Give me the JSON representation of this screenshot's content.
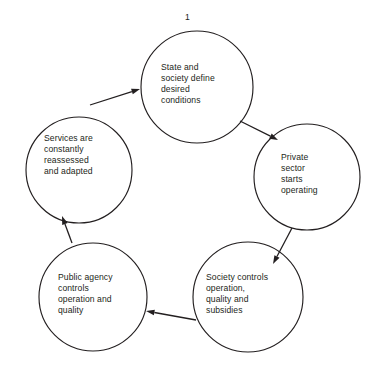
{
  "figure": {
    "number_label": "1",
    "background_color": "#ffffff",
    "stroke_color": "#231f20",
    "text_color": "#231f20"
  },
  "nodes": [
    {
      "id": "state-society-define",
      "text": "State and\nsociety define\ndesired\nconditions",
      "cx": 197,
      "cy": 87,
      "r": 56,
      "text_left": 161,
      "text_top": 62
    },
    {
      "id": "private-sector-operating",
      "text": "Private\nsector\nstarts\noperating",
      "cx": 307,
      "cy": 177,
      "r": 53,
      "text_left": 281,
      "text_top": 152
    },
    {
      "id": "society-controls",
      "text": "Society controls\noperation,\nquality and\nsubsidies",
      "cx": 248,
      "cy": 297,
      "r": 55,
      "text_left": 206,
      "text_top": 272
    },
    {
      "id": "public-agency-controls",
      "text": "Public agency\ncontrols\noperation and\nquality",
      "cx": 93,
      "cy": 297,
      "r": 54,
      "text_left": 58,
      "text_top": 272
    },
    {
      "id": "services-reassessed",
      "text": "Services are\nconstantly\nreassessed\nand adapted",
      "cx": 79,
      "cy": 170,
      "r": 53,
      "text_left": 44,
      "text_top": 133
    }
  ],
  "arrows": [
    {
      "id": "arrow-state-to-private",
      "from": "state-society-define",
      "to": "private-sector-operating",
      "x1": 240,
      "y1": 121,
      "x2": 278,
      "y2": 140
    },
    {
      "id": "arrow-private-to-society",
      "from": "private-sector-operating",
      "to": "society-controls",
      "x1": 292,
      "y1": 228,
      "x2": 273,
      "y2": 264
    },
    {
      "id": "arrow-society-to-public-agency",
      "from": "society-controls",
      "to": "public-agency-controls",
      "x1": 196,
      "y1": 320,
      "x2": 146,
      "y2": 311
    },
    {
      "id": "arrow-public-agency-to-services",
      "from": "public-agency-controls",
      "to": "services-reassessed",
      "x1": 72,
      "y1": 243,
      "x2": 62,
      "y2": 216
    },
    {
      "id": "arrow-services-to-state",
      "from": "services-reassessed",
      "to": "state-society-define",
      "x1": 90,
      "y1": 105,
      "x2": 140,
      "y2": 89
    }
  ]
}
